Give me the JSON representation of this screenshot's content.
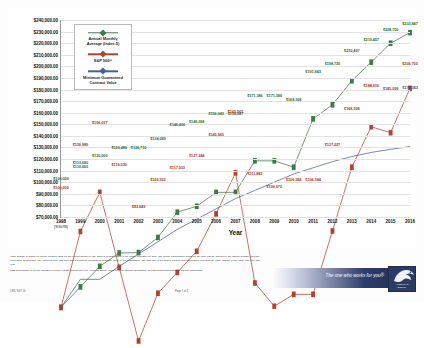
{
  "chart_data": {
    "type": "line",
    "title": "",
    "xlabel": "Year",
    "ylabel": "",
    "ylim": [
      70000,
      240000
    ],
    "ytick_step": 10000,
    "grid": true,
    "legend_position": "upper-left-inside",
    "x": [
      1998,
      1999,
      2000,
      2001,
      2002,
      2003,
      2004,
      2005,
      2006,
      2007,
      2008,
      2009,
      2010,
      2011,
      2012,
      2013,
      2014,
      2015,
      2016
    ],
    "xtick_labels": [
      "1998",
      "1999",
      "2000",
      "2001",
      "2002",
      "2003",
      "2004",
      "2005",
      "2006",
      "2007",
      "2008",
      "2009",
      "2010",
      "2011",
      "2012",
      "2013",
      "2014",
      "2015",
      "2016"
    ],
    "x_first_sublabel": "(9/30/98)",
    "yticks": [
      "$240,000.00",
      "$230,000.00",
      "$220,000.00",
      "$210,000.00",
      "$200,000.00",
      "$190,000.00",
      "$180,000.00",
      "$170,000.00",
      "$160,000.00",
      "$150,000.00",
      "$140,000.00",
      "$130,000.00",
      "$120,000.00",
      "$110,000.00",
      "$100,000.00",
      "$90,000.00",
      "$80,000.00",
      "$70,000.00"
    ],
    "series": [
      {
        "name": "Annual Monthly Average (Index-5)",
        "color": "#3f7a46",
        "values": [
          100000,
          110000,
          120000,
          126489,
          126710,
          134089,
          146406,
          149268,
          156043,
          156047,
          171386,
          171386,
          168308,
          191843,
          198720,
          210407,
          219457,
          228700,
          233847
        ],
        "labels": [
          "$100,000",
          "$110,000",
          "$120,000",
          "$126,489",
          "$126,710",
          "$134,089",
          "$146,406",
          "$149,268",
          "$156,043",
          "$156,047",
          "$171,386",
          "$171,386",
          "$168,308",
          "$191,843",
          "$198,720",
          "$210,407",
          "$219,457",
          "$228,700",
          "$233,847"
        ]
      },
      {
        "name": "S&P 500®",
        "color": "#b0452f",
        "values": [
          100000,
          136989,
          156037,
          119530,
          83649,
          106932,
          117033,
          127344,
          145565,
          165565,
          111882,
          100570,
          106384,
          106384,
          137227,
          168308,
          188016,
          185099,
          206700
        ],
        "labels": [
          "$100,000",
          "$136,989",
          "$156,037",
          "$119,530",
          "$83,649",
          "$106,932",
          "$117,033",
          "$127,344",
          "$145,565",
          "$165,565",
          "$111,882",
          "$100,570",
          "$106,384",
          "$106,384",
          "$137,227",
          "$168,308",
          "$188,016",
          "$185,099",
          "$206,700"
        ]
      },
      {
        "name": "Minimum Guaranteed Contract Value",
        "color": "#4a5da3",
        "values": [
          100000,
          113690,
          113690,
          120000,
          126000,
          132000,
          138000,
          143000,
          148000,
          153000,
          157000,
          161000,
          165000,
          168000,
          171000,
          173500,
          175500,
          177000,
          178343
        ],
        "labels": [
          "",
          "$113,690",
          "",
          "",
          "",
          "",
          "",
          "",
          "",
          "",
          "",
          "",
          "",
          "",
          "",
          "",
          "",
          "",
          "$178,343"
        ]
      }
    ]
  },
  "legend": {
    "entries": [
      {
        "label": "Annual Monthly\nAverage (Index-5)",
        "color": "#3f7a46",
        "swatch": "line-diamond-marker"
      },
      {
        "label": "S&P 500®",
        "color": "#b0452f",
        "swatch": "line-square-marker"
      },
      {
        "label": "Minimum Guaranteed\nContract Value",
        "color": "#4a5da3",
        "swatch": "line-diamond-marker"
      }
    ]
  },
  "footer": {
    "disclaimer_1": "*This graphic is based on actual credited rates for the period shown on the Index-5 product which is no longer available for sale. The actual Participation Rates for the time period, applied to the annual monthly average, calculation as depicted, vary between 50% and 75% and a Minimum Guaranteed Contract Value of 3% is assumed. The S&P 500 is an annual point-to-point calculation depicting the index change in the index rate over one year.",
    "disclaimer_2": "Past performance is not an indication of future results. Please call your American Equity Agent for more product information. Review product disclosure for specific information.",
    "doc_code": "1381 SGT 16",
    "page_number": "Page 1 of 1"
  },
  "brand": {
    "tagline": "The one who works for you®",
    "logo_name": "AMERICAN\nEQUITY",
    "icon": "eagle-icon"
  }
}
